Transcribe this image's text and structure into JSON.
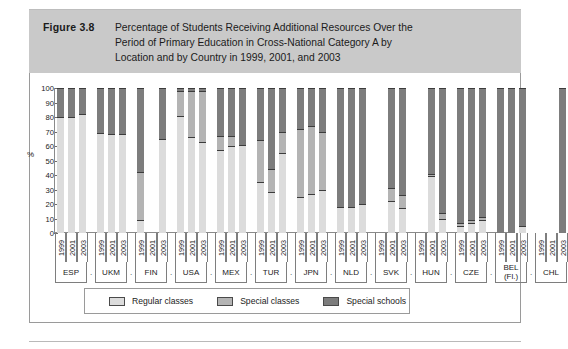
{
  "figure": {
    "number_label": "Figure 3.8",
    "title_lines": [
      "Percentage of Students Receiving Additional Resources Over the",
      "Period of Primary Education in Cross-National Category A by",
      "Location and by Country in 1999, 2001, and 2003"
    ]
  },
  "axis": {
    "y_label": "%",
    "y_ticks": [
      "100",
      "90",
      "80",
      "70",
      "60",
      "50",
      "40",
      "30",
      "20",
      "10",
      "0"
    ],
    "years": [
      "1999",
      "2001",
      "2003"
    ]
  },
  "legend": {
    "items": [
      {
        "label": "Regular classes",
        "color": "#dcdcdc"
      },
      {
        "label": "Special classes",
        "color": "#b4b4b4"
      },
      {
        "label": "Special schools",
        "color": "#7d7d7d"
      }
    ]
  },
  "colors": {
    "header_band": "#c9c9c9",
    "regular_classes": "#dcdcdc",
    "special_classes": "#b4b4b4",
    "special_schools": "#7d7d7d",
    "frame": "#9a9a9a"
  },
  "chart_data": {
    "type": "bar",
    "subtype": "stacked-grouped",
    "title": "Percentage of Students Receiving Additional Resources Over the Period of Primary Education in Cross-National Category A by Location and by Country in 1999, 2001, and 2003",
    "xlabel": "",
    "ylabel": "%",
    "ylim": [
      0,
      100
    ],
    "grid": false,
    "legend_position": "bottom",
    "categories": [
      "1999",
      "2001",
      "2003"
    ],
    "series": [
      {
        "name": "Regular classes",
        "color": "#dcdcdc"
      },
      {
        "name": "Special classes",
        "color": "#b4b4b4"
      },
      {
        "name": "Special schools",
        "color": "#7d7d7d"
      }
    ],
    "countries": [
      {
        "code": "ESP",
        "bars": [
          {
            "year": "1999",
            "regular": 80,
            "special_classes": 0,
            "special_schools": 20
          },
          {
            "year": "2001",
            "regular": 80,
            "special_classes": 0,
            "special_schools": 20
          },
          {
            "year": "2003",
            "regular": 82,
            "special_classes": 0,
            "special_schools": 18
          }
        ]
      },
      {
        "code": "UKM",
        "bars": [
          {
            "year": "1999",
            "regular": 69,
            "special_classes": 0,
            "special_schools": 31
          },
          {
            "year": "2001",
            "regular": 68,
            "special_classes": 0,
            "special_schools": 32
          },
          {
            "year": "2003",
            "regular": 68,
            "special_classes": 0,
            "special_schools": 32
          }
        ]
      },
      {
        "code": "FIN",
        "bars": [
          {
            "year": "1999",
            "regular": 9,
            "special_classes": 33,
            "special_schools": 58
          },
          {
            "year": "2001",
            "regular": 0,
            "special_classes": 0,
            "special_schools": 0
          },
          {
            "year": "2003",
            "regular": 65,
            "special_classes": 0,
            "special_schools": 35
          }
        ]
      },
      {
        "code": "USA",
        "bars": [
          {
            "year": "1999",
            "regular": 81,
            "special_classes": 17,
            "special_schools": 2
          },
          {
            "year": "2001",
            "regular": 66,
            "special_classes": 32,
            "special_schools": 2
          },
          {
            "year": "2003",
            "regular": 63,
            "special_classes": 35,
            "special_schools": 2
          }
        ]
      },
      {
        "code": "MEX",
        "bars": [
          {
            "year": "1999",
            "regular": 57,
            "special_classes": 10,
            "special_schools": 33
          },
          {
            "year": "2001",
            "regular": 60,
            "special_classes": 7,
            "special_schools": 33
          },
          {
            "year": "2003",
            "regular": 61,
            "special_classes": 0,
            "special_schools": 39
          }
        ]
      },
      {
        "code": "TUR",
        "bars": [
          {
            "year": "1999",
            "regular": 35,
            "special_classes": 29,
            "special_schools": 36
          },
          {
            "year": "2001",
            "regular": 28,
            "special_classes": 16,
            "special_schools": 56
          },
          {
            "year": "2003",
            "regular": 55,
            "special_classes": 15,
            "special_schools": 30
          }
        ]
      },
      {
        "code": "JPN",
        "bars": [
          {
            "year": "1999",
            "regular": 25,
            "special_classes": 47,
            "special_schools": 28
          },
          {
            "year": "2001",
            "regular": 27,
            "special_classes": 47,
            "special_schools": 26
          },
          {
            "year": "2003",
            "regular": 30,
            "special_classes": 40,
            "special_schools": 30
          }
        ]
      },
      {
        "code": "NLD",
        "bars": [
          {
            "year": "1999",
            "regular": 18,
            "special_classes": 0,
            "special_schools": 82
          },
          {
            "year": "2001",
            "regular": 18,
            "special_classes": 0,
            "special_schools": 82
          },
          {
            "year": "2003",
            "regular": 20,
            "special_classes": 0,
            "special_schools": 80
          }
        ]
      },
      {
        "code": "SVK",
        "bars": [
          {
            "year": "1999",
            "regular": 0,
            "special_classes": 0,
            "special_schools": 0
          },
          {
            "year": "2001",
            "regular": 22,
            "special_classes": 9,
            "special_schools": 69
          },
          {
            "year": "2003",
            "regular": 17,
            "special_classes": 9,
            "special_schools": 74
          }
        ]
      },
      {
        "code": "HUN",
        "bars": [
          {
            "year": "1999",
            "regular": 0,
            "special_classes": 0,
            "special_schools": 0
          },
          {
            "year": "2001",
            "regular": 39,
            "special_classes": 2,
            "special_schools": 59
          },
          {
            "year": "2003",
            "regular": 10,
            "special_classes": 4,
            "special_schools": 86
          }
        ]
      },
      {
        "code": "CZE",
        "bars": [
          {
            "year": "1999",
            "regular": 5,
            "special_classes": 2,
            "special_schools": 93
          },
          {
            "year": "2001",
            "regular": 7,
            "special_classes": 2,
            "special_schools": 91
          },
          {
            "year": "2003",
            "regular": 9,
            "special_classes": 2,
            "special_schools": 89
          }
        ]
      },
      {
        "code": "BEL (Fl.)",
        "bars": [
          {
            "year": "1999",
            "regular": 0,
            "special_classes": 0,
            "special_schools": 100
          },
          {
            "year": "2001",
            "regular": 0,
            "special_classes": 0,
            "special_schools": 100
          },
          {
            "year": "2003",
            "regular": 5,
            "special_classes": 0,
            "special_schools": 95
          }
        ]
      },
      {
        "code": "CHL",
        "bars": [
          {
            "year": "1999",
            "regular": 0,
            "special_classes": 0,
            "special_schools": 0
          },
          {
            "year": "2001",
            "regular": 0,
            "special_classes": 0,
            "special_schools": 0
          },
          {
            "year": "2003",
            "regular": 0,
            "special_classes": 0,
            "special_schools": 100
          }
        ]
      }
    ]
  }
}
